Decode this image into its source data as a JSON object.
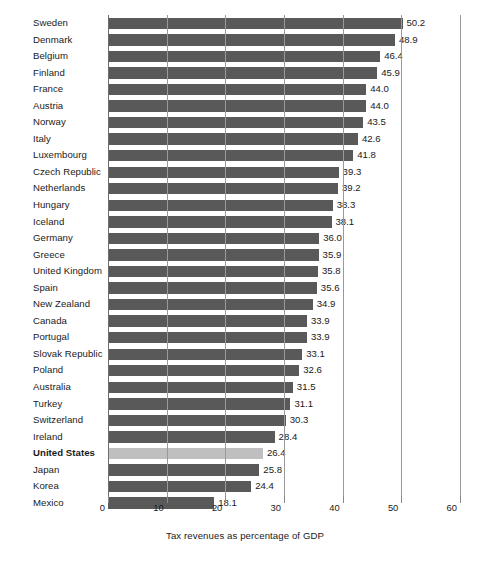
{
  "chart_data": {
    "type": "bar",
    "orientation": "horizontal",
    "title": "",
    "xlabel": "Tax revenues as percentage of GDP",
    "ylabel": "",
    "xlim": [
      0,
      60
    ],
    "xticks": [
      0,
      10,
      20,
      30,
      40,
      50,
      60
    ],
    "xtick_labels": [
      "0",
      "10",
      "20",
      "30",
      "40",
      "50",
      "60"
    ],
    "grid": "vertical",
    "legend": "none",
    "categories": [
      "Sweden",
      "Denmark",
      "Belgium",
      "Finland",
      "France",
      "Austria",
      "Norway",
      "Italy",
      "Luxembourg",
      "Czech Republic",
      "Netherlands",
      "Hungary",
      "Iceland",
      "Germany",
      "Greece",
      "United Kingdom",
      "Spain",
      "New Zealand",
      "Canada",
      "Portugal",
      "Slovak Republic",
      "Poland",
      "Australia",
      "Turkey",
      "Switzerland",
      "Ireland",
      "United States",
      "Japan",
      "Korea",
      "Mexico"
    ],
    "values": [
      50.2,
      48.9,
      46.4,
      45.9,
      44.0,
      44.0,
      43.5,
      42.6,
      41.8,
      39.3,
      39.2,
      38.3,
      38.1,
      36.0,
      35.9,
      35.8,
      35.6,
      34.9,
      33.9,
      33.9,
      33.1,
      32.6,
      31.5,
      31.1,
      30.3,
      28.4,
      26.4,
      25.8,
      24.4,
      18.1
    ],
    "value_labels": [
      "50.2",
      "48.9",
      "46.4",
      "45.9",
      "44.0",
      "44.0",
      "43.5",
      "42.6",
      "41.8",
      "39.3",
      "39.2",
      "38.3",
      "38.1",
      "36.0",
      "35.9",
      "35.8",
      "35.6",
      "34.9",
      "33.9",
      "33.9",
      "33.1",
      "32.6",
      "31.5",
      "31.1",
      "30.3",
      "28.4",
      "26.4",
      "25.8",
      "24.4",
      "18.1"
    ],
    "highlighted_category": "United States",
    "colors": {
      "bar": "#595959",
      "bar_highlight": "#bfbfbf",
      "gridline": "#9a9a9a",
      "background": "#ffffff",
      "text": "#1a1a1a"
    }
  }
}
